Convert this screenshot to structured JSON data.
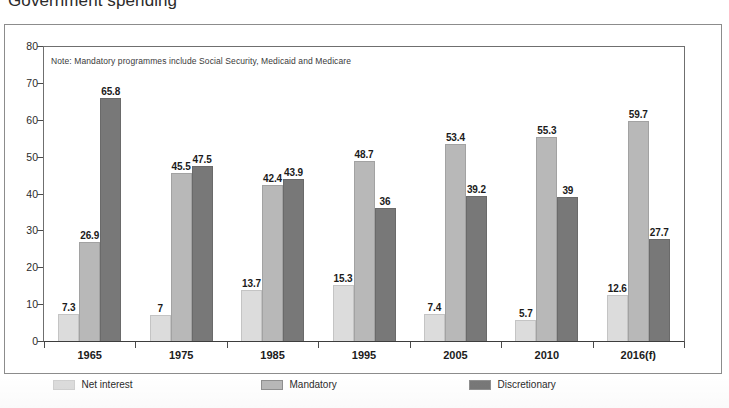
{
  "chart_title": "Government spending",
  "note": "Note: Mandatory programmes include Social Security, Medicaid and Medicare",
  "colors": {
    "net_interest": "#dcdcdc",
    "mandatory": "#b8b8b8",
    "discretionary": "#787878",
    "axis": "#4a4a4a",
    "frame": "#8c8c8c",
    "text": "#1b1b1b"
  },
  "legend": {
    "position": "bottom",
    "items": [
      {
        "label": "Net interest",
        "color": "#dcdcdc"
      },
      {
        "label": "Mandatory",
        "color": "#b8b8b8"
      },
      {
        "label": "Discretionary",
        "color": "#787878"
      }
    ]
  },
  "chart_data": {
    "type": "bar",
    "title": "Government spending",
    "subtitle": "",
    "xlabel": "",
    "ylabel": "",
    "note": "Note: Mandatory programmes include Social Security, Medicaid and Medicare",
    "grid": false,
    "legend_position": "bottom",
    "ylim": [
      0,
      80
    ],
    "yticks": [
      0,
      10,
      20,
      30,
      40,
      50,
      60,
      70,
      80
    ],
    "ytick_labels": [
      "0",
      "10",
      "20",
      "30",
      "40",
      "50",
      "60",
      "70",
      "80"
    ],
    "categories": [
      "1965",
      "1975",
      "1985",
      "1995",
      "2005",
      "2010",
      "2016(f)"
    ],
    "series": [
      {
        "name": "Net interest",
        "color": "#dcdcdc",
        "values": [
          7.3,
          7,
          13.7,
          15.3,
          7.4,
          5.7,
          12.6
        ],
        "labels": [
          "7.3",
          "7",
          "13.7",
          "15.3",
          "7.4",
          "5.7",
          "12.6"
        ]
      },
      {
        "name": "Mandatory",
        "color": "#b8b8b8",
        "values": [
          26.9,
          45.5,
          42.4,
          48.7,
          53.4,
          55.3,
          59.7
        ],
        "labels": [
          "26.9",
          "45.5",
          "42.4",
          "48.7",
          "53.4",
          "55.3",
          "59.7"
        ]
      },
      {
        "name": "Discretionary",
        "color": "#787878",
        "values": [
          65.8,
          47.5,
          43.9,
          36,
          39.2,
          39,
          27.7
        ],
        "labels": [
          "65.8",
          "47.5",
          "43.9",
          "36",
          "39.2",
          "39",
          "27.7"
        ]
      }
    ]
  }
}
